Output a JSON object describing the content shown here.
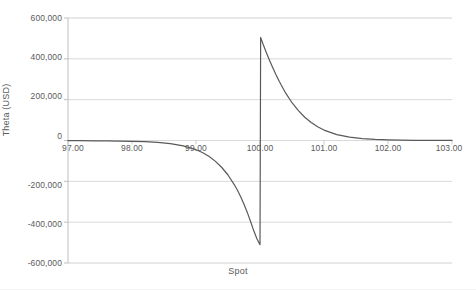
{
  "chart_data": {
    "type": "line",
    "title": "",
    "xlabel": "Spot",
    "ylabel": "Theta (USD)",
    "xlim": [
      97,
      103
    ],
    "ylim": [
      -600000,
      600000
    ],
    "grid": true,
    "legend": "none",
    "x_ticks": [
      "97.00",
      "98.00",
      "99.00",
      "100.00",
      "101.00",
      "102.00",
      "103.00"
    ],
    "x_tick_values": [
      97,
      98,
      99,
      100,
      101,
      102,
      103
    ],
    "y_ticks": [
      "600,000",
      "400,000",
      "200,000",
      "0",
      "-200,000",
      "-400,000",
      "-600,000"
    ],
    "y_tick_values": [
      600000,
      400000,
      200000,
      0,
      -200000,
      -400000,
      -600000
    ],
    "series": [
      {
        "name": "Theta",
        "color": "#595959",
        "x": [
          97.0,
          97.2,
          97.4,
          97.6,
          97.8,
          98.0,
          98.2,
          98.4,
          98.6,
          98.8,
          99.0,
          99.1,
          99.2,
          99.3,
          99.4,
          99.5,
          99.6,
          99.65,
          99.7,
          99.75,
          99.8,
          99.85,
          99.9,
          99.95,
          99.99,
          100.0,
          100.01,
          100.05,
          100.1,
          100.15,
          100.2,
          100.25,
          100.3,
          100.4,
          100.5,
          100.6,
          100.7,
          100.8,
          100.9,
          101.0,
          101.2,
          101.4,
          101.6,
          101.8,
          102.0,
          102.4,
          102.8,
          103.0
        ],
        "y": [
          -900,
          -1100,
          -1500,
          -2000,
          -2800,
          -4000,
          -6000,
          -9500,
          -15500,
          -26000,
          -45000,
          -59000,
          -77000,
          -101000,
          -131000,
          -169000,
          -217000,
          -245000,
          -277000,
          -312000,
          -351000,
          -394000,
          -440000,
          -480000,
          -505000,
          -510000,
          505000,
          470000,
          430000,
          392000,
          356000,
          322000,
          290000,
          233000,
          185000,
          146000,
          114000,
          88000,
          67000,
          51000,
          29000,
          16500,
          9300,
          5300,
          3000,
          1000,
          400,
          250
        ]
      }
    ]
  },
  "axes": {
    "y_title": "Theta (USD)",
    "x_title": "Spot"
  }
}
